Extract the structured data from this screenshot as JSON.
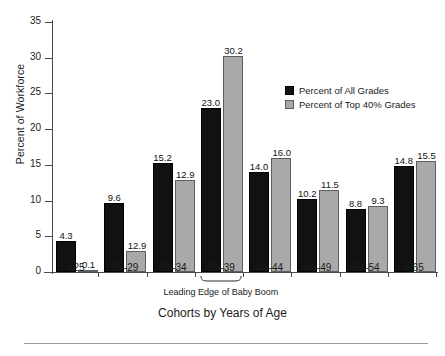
{
  "chart_data": {
    "type": "bar",
    "title": "",
    "xlabel": "Cohorts by Years of Age",
    "ylabel": "Percent of Workforce",
    "ylim": [
      0,
      35
    ],
    "yticks": [
      0,
      5,
      10,
      15,
      20,
      25,
      30,
      35
    ],
    "grid": false,
    "legend_position": "upper right",
    "categories": [
      "<25",
      "25–29",
      "30–34",
      "35–39",
      "40–44",
      "45–49",
      "50–54",
      "> 65"
    ],
    "series": [
      {
        "name": "Percent of All Grades",
        "color": "#111111",
        "values": [
          4.3,
          9.6,
          15.2,
          23.0,
          14.0,
          10.2,
          8.8,
          14.8
        ],
        "labels": [
          "4.3",
          "9.6",
          "15.2",
          "23.0",
          "14.0",
          "10.2",
          "8.8",
          "14.8"
        ]
      },
      {
        "name": "Percent of Top 40% Grades",
        "color": "#a9a9a9",
        "values": [
          0.1,
          2.9,
          12.9,
          30.2,
          16.0,
          11.5,
          9.3,
          15.5
        ],
        "labels": [
          "0.1",
          "12.9",
          "12.9",
          "30.2",
          "16.0",
          "11.5",
          "9.3",
          "15.5"
        ]
      }
    ],
    "annotations": [
      {
        "text": "Leading Edge of Baby Boom",
        "target_category": "35–39",
        "style": "underbrace"
      }
    ]
  },
  "axis": {
    "ytick_labels": [
      "0",
      "5",
      "10",
      "15",
      "20",
      "25",
      "30",
      "35"
    ],
    "y_title": "Percent of Workforce",
    "x_title": "Cohorts by Years of Age",
    "x_categories": [
      "<25",
      "25–29",
      "30–34",
      "35–39",
      "40–44",
      "45–49",
      "50–54",
      "> 65"
    ]
  },
  "legend": {
    "items": [
      {
        "label": "Percent of All Grades",
        "color": "#111111"
      },
      {
        "label": "Percent of Top 40% Grades",
        "color": "#a9a9a9"
      }
    ]
  },
  "annotation": {
    "baby_boom": "Leading Edge of Baby Boom"
  }
}
